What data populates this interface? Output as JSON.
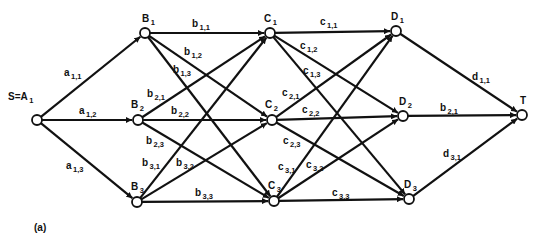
{
  "figure": {
    "caption": "(a)",
    "colors": {
      "ink": "#111111",
      "background": "#ffffff",
      "node_fill": "#ffffff"
    }
  },
  "nodes": [
    {
      "id": "S",
      "label": "S=A",
      "sub": "1",
      "x": 37,
      "y": 120,
      "lx": 8,
      "ly": 100
    },
    {
      "id": "B1",
      "label": "B",
      "sub": "1",
      "x": 145,
      "y": 33,
      "lx": 142,
      "ly": 22
    },
    {
      "id": "B2",
      "label": "B",
      "sub": "2",
      "x": 138,
      "y": 120,
      "lx": 131,
      "ly": 108
    },
    {
      "id": "B3",
      "label": "B",
      "sub": "3",
      "x": 137,
      "y": 202,
      "lx": 131,
      "ly": 190
    },
    {
      "id": "C1",
      "label": "C",
      "sub": "1",
      "x": 270,
      "y": 33,
      "lx": 264,
      "ly": 22
    },
    {
      "id": "C2",
      "label": "C",
      "sub": "2",
      "x": 272,
      "y": 120,
      "lx": 265,
      "ly": 108
    },
    {
      "id": "C3",
      "label": "C",
      "sub": "3",
      "x": 274,
      "y": 201,
      "lx": 268,
      "ly": 189
    },
    {
      "id": "D1",
      "label": "D",
      "sub": "1",
      "x": 396,
      "y": 31,
      "lx": 391,
      "ly": 20
    },
    {
      "id": "D2",
      "label": "D",
      "sub": "2",
      "x": 403,
      "y": 116,
      "lx": 399,
      "ly": 105
    },
    {
      "id": "D3",
      "label": "D",
      "sub": "3",
      "x": 409,
      "y": 199,
      "lx": 404,
      "ly": 188
    },
    {
      "id": "T",
      "label": "T",
      "sub": "",
      "x": 522,
      "y": 115,
      "lx": 520,
      "ly": 104
    }
  ],
  "edges": [
    {
      "from": "S",
      "to": "B1",
      "label": "a",
      "sub": "1,1",
      "lx": 64,
      "ly": 76
    },
    {
      "from": "S",
      "to": "B2",
      "label": "a",
      "sub": "1,2",
      "lx": 79,
      "ly": 114
    },
    {
      "from": "S",
      "to": "B3",
      "label": "a",
      "sub": "1,3",
      "lx": 66,
      "ly": 169
    },
    {
      "from": "B1",
      "to": "C1",
      "label": "b",
      "sub": "1,1",
      "lx": 192,
      "ly": 27
    },
    {
      "from": "B1",
      "to": "C2",
      "label": "b",
      "sub": "1,2",
      "lx": 184,
      "ly": 55
    },
    {
      "from": "B1",
      "to": "C3",
      "label": "b",
      "sub": "1,3",
      "lx": 173,
      "ly": 73
    },
    {
      "from": "B2",
      "to": "C1",
      "label": "b",
      "sub": "2,1",
      "lx": 147,
      "ly": 97
    },
    {
      "from": "B2",
      "to": "C2",
      "label": "b",
      "sub": "2,2",
      "lx": 171,
      "ly": 114
    },
    {
      "from": "B2",
      "to": "C3",
      "label": "b",
      "sub": "2,3",
      "lx": 146,
      "ly": 144
    },
    {
      "from": "B3",
      "to": "C1",
      "label": "b",
      "sub": "3,1",
      "lx": 142,
      "ly": 166
    },
    {
      "from": "B3",
      "to": "C2",
      "label": "b",
      "sub": "3,2",
      "lx": 176,
      "ly": 166
    },
    {
      "from": "B3",
      "to": "C3",
      "label": "b",
      "sub": "3,3",
      "lx": 195,
      "ly": 196
    },
    {
      "from": "C1",
      "to": "D1",
      "label": "c",
      "sub": "1,1",
      "lx": 320,
      "ly": 25
    },
    {
      "from": "C1",
      "to": "D2",
      "label": "c",
      "sub": "1,2",
      "lx": 300,
      "ly": 49
    },
    {
      "from": "C1",
      "to": "D3",
      "label": "c",
      "sub": "1,3",
      "lx": 303,
      "ly": 74
    },
    {
      "from": "C2",
      "to": "D1",
      "label": "c",
      "sub": "2,1",
      "lx": 282,
      "ly": 96
    },
    {
      "from": "C2",
      "to": "D2",
      "label": "c",
      "sub": "2,2",
      "lx": 302,
      "ly": 113
    },
    {
      "from": "C2",
      "to": "D3",
      "label": "c",
      "sub": "2,3",
      "lx": 283,
      "ly": 144
    },
    {
      "from": "C3",
      "to": "D1",
      "label": "c",
      "sub": "3,1",
      "lx": 278,
      "ly": 170
    },
    {
      "from": "C3",
      "to": "D2",
      "label": "c",
      "sub": "3,2",
      "lx": 306,
      "ly": 168
    },
    {
      "from": "C3",
      "to": "D3",
      "label": "c",
      "sub": "3,3",
      "lx": 332,
      "ly": 196
    },
    {
      "from": "D1",
      "to": "T",
      "label": "d",
      "sub": "1,1",
      "lx": 472,
      "ly": 80
    },
    {
      "from": "D2",
      "to": "T",
      "label": "b",
      "sub": "2,1",
      "lx": 440,
      "ly": 111
    },
    {
      "from": "D3",
      "to": "T",
      "label": "d",
      "sub": "3,1",
      "lx": 443,
      "ly": 157
    }
  ]
}
